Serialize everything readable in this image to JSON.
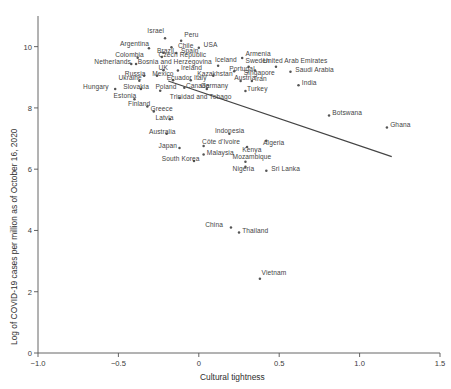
{
  "chart_data": {
    "type": "scatter",
    "title": "",
    "xlabel": "Cultural tightness",
    "ylabel": "Log of COVID-19 cases per million as of October 16, 2020",
    "xlim": [
      -1.0,
      1.5
    ],
    "ylim": [
      0,
      11
    ],
    "xticks": [
      "-1.0",
      "-0.5",
      "0",
      "0.5",
      "1.0",
      "1.5"
    ],
    "xtick_values": [
      -1.0,
      -0.5,
      0,
      0.5,
      1.0,
      1.5
    ],
    "yticks": [
      "0",
      "2",
      "4",
      "6",
      "8",
      "10"
    ],
    "ytick_values": [
      0,
      2,
      4,
      6,
      8,
      10
    ],
    "grid": false,
    "legend": "none",
    "marker_color": "#555555",
    "line_color": "#444444",
    "trendline": {
      "x0": -0.19,
      "y0": 8.88,
      "x1": 1.2,
      "y1": 6.41
    },
    "points": [
      {
        "label": "Israel",
        "x": -0.21,
        "y": 10.27,
        "lx": -0.32,
        "ly": 10.47
      },
      {
        "label": "Peru",
        "x": -0.11,
        "y": 10.19,
        "lx": -0.09,
        "ly": 10.36
      },
      {
        "label": "Argentina",
        "x": -0.31,
        "y": 9.95,
        "lx": -0.49,
        "ly": 10.04
      },
      {
        "label": "Chile",
        "x": -0.17,
        "y": 9.98,
        "lx": -0.13,
        "ly": 10.0
      },
      {
        "label": "USA",
        "x": 0.0,
        "y": 9.96,
        "lx": 0.03,
        "ly": 10.03
      },
      {
        "label": "Brazil",
        "x": -0.22,
        "y": 9.8,
        "lx": -0.26,
        "ly": 9.84
      },
      {
        "label": "Spain",
        "x": -0.14,
        "y": 9.79,
        "lx": -0.11,
        "ly": 9.83
      },
      {
        "label": "Colombia",
        "x": -0.38,
        "y": 9.64,
        "lx": -0.52,
        "ly": 9.68
      },
      {
        "label": "Czech Republic",
        "x": -0.23,
        "y": 9.66,
        "lx": -0.25,
        "ly": 9.7
      },
      {
        "label": "Armenia",
        "x": 0.27,
        "y": 9.63,
        "lx": 0.29,
        "ly": 9.73
      },
      {
        "label": "Netherlands",
        "x": -0.42,
        "y": 9.43,
        "lx": -0.65,
        "ly": 9.47
      },
      {
        "label": "Bosnia and Herzegovina",
        "x": -0.39,
        "y": 9.43,
        "lx": -0.38,
        "ly": 9.47
      },
      {
        "label": "Iceland",
        "x": 0.12,
        "y": 9.38,
        "lx": 0.1,
        "ly": 9.53
      },
      {
        "label": "Sweden",
        "x": 0.31,
        "y": 9.34,
        "lx": 0.29,
        "ly": 9.5
      },
      {
        "label": "United Arab Emirates",
        "x": 0.48,
        "y": 9.34,
        "lx": 0.4,
        "ly": 9.51
      },
      {
        "label": "UK",
        "x": -0.22,
        "y": 9.23,
        "lx": -0.25,
        "ly": 9.28
      },
      {
        "label": "Ireland",
        "x": -0.13,
        "y": 9.22,
        "lx": -0.11,
        "ly": 9.27
      },
      {
        "label": "Portugal",
        "x": 0.22,
        "y": 9.2,
        "lx": 0.19,
        "ly": 9.25
      },
      {
        "label": "Singapore",
        "x": 0.35,
        "y": 9.22,
        "lx": 0.28,
        "ly": 9.12
      },
      {
        "label": "Saudi Arabia",
        "x": 0.57,
        "y": 9.18,
        "lx": 0.6,
        "ly": 9.21
      },
      {
        "label": "Russia",
        "x": -0.34,
        "y": 9.05,
        "lx": -0.46,
        "ly": 9.09
      },
      {
        "label": "Mexico",
        "x": -0.26,
        "y": 9.05,
        "lx": -0.29,
        "ly": 9.09
      },
      {
        "label": "Kazakhstan",
        "x": 0.09,
        "y": 9.05,
        "lx": -0.01,
        "ly": 9.09
      },
      {
        "label": "Ukraine",
        "x": -0.37,
        "y": 8.89,
        "lx": -0.5,
        "ly": 8.93
      },
      {
        "label": "Ecuador",
        "x": -0.16,
        "y": 8.9,
        "lx": -0.2,
        "ly": 8.94
      },
      {
        "label": "Italy",
        "x": -0.05,
        "y": 8.9,
        "lx": -0.03,
        "ly": 8.94
      },
      {
        "label": "Austria",
        "x": 0.26,
        "y": 8.88,
        "lx": 0.22,
        "ly": 8.93
      },
      {
        "label": "Iran",
        "x": 0.33,
        "y": 8.88,
        "lx": 0.35,
        "ly": 8.92
      },
      {
        "label": "Hungary",
        "x": -0.52,
        "y": 8.62,
        "lx": -0.72,
        "ly": 8.66
      },
      {
        "label": "Slovakia",
        "x": -0.36,
        "y": 8.62,
        "lx": -0.47,
        "ly": 8.66
      },
      {
        "label": "Poland",
        "x": -0.24,
        "y": 8.56,
        "lx": -0.27,
        "ly": 8.65
      },
      {
        "label": "Canada",
        "x": -0.09,
        "y": 8.66,
        "lx": -0.08,
        "ly": 8.68
      },
      {
        "label": "Germany",
        "x": 0.05,
        "y": 8.62,
        "lx": 0.01,
        "ly": 8.67
      },
      {
        "label": "Turkey",
        "x": 0.29,
        "y": 8.55,
        "lx": 0.3,
        "ly": 8.58
      },
      {
        "label": "Estonia",
        "x": -0.4,
        "y": 8.28,
        "lx": -0.53,
        "ly": 8.36
      },
      {
        "label": "Trinidad and Tobago",
        "x": -0.12,
        "y": 8.32,
        "lx": -0.18,
        "ly": 8.33
      },
      {
        "label": "India",
        "x": 0.62,
        "y": 8.74,
        "lx": 0.64,
        "ly": 8.78
      },
      {
        "label": "Finland",
        "x": -0.32,
        "y": 8.05,
        "lx": -0.44,
        "ly": 8.1
      },
      {
        "label": "Greece",
        "x": -0.28,
        "y": 7.88,
        "lx": -0.3,
        "ly": 7.93
      },
      {
        "label": "Latvia",
        "x": -0.18,
        "y": 7.63,
        "lx": -0.27,
        "ly": 7.65
      },
      {
        "label": "Botswana",
        "x": 0.81,
        "y": 7.75,
        "lx": 0.83,
        "ly": 7.79
      },
      {
        "label": "Ghana",
        "x": 1.17,
        "y": 7.36,
        "lx": 1.19,
        "ly": 7.41
      },
      {
        "label": "Australia",
        "x": -0.2,
        "y": 7.16,
        "lx": -0.31,
        "ly": 7.18
      },
      {
        "label": "Indonesia",
        "x": 0.19,
        "y": 7.16,
        "lx": 0.1,
        "ly": 7.2
      },
      {
        "label": "Algeria",
        "x": 0.42,
        "y": 6.93,
        "lx": 0.4,
        "ly": 6.83
      },
      {
        "label": "Côte d'Ivoire",
        "x": 0.03,
        "y": 6.76,
        "lx": 0.02,
        "ly": 6.86
      },
      {
        "label": "Japan",
        "x": -0.12,
        "y": 6.69,
        "lx": -0.25,
        "ly": 6.72
      },
      {
        "label": "Kenya",
        "x": 0.3,
        "y": 6.72,
        "lx": 0.27,
        "ly": 6.58
      },
      {
        "label": "Malaysia",
        "x": 0.03,
        "y": 6.48,
        "lx": 0.05,
        "ly": 6.5
      },
      {
        "label": "Mozambique",
        "x": 0.29,
        "y": 6.24,
        "lx": 0.21,
        "ly": 6.36
      },
      {
        "label": "South Korea",
        "x": -0.03,
        "y": 6.27,
        "lx": -0.23,
        "ly": 6.29
      },
      {
        "label": "Nigeria",
        "x": 0.29,
        "y": 6.08,
        "lx": 0.21,
        "ly": 5.96
      },
      {
        "label": "Sri Lanka",
        "x": 0.42,
        "y": 5.95,
        "lx": 0.45,
        "ly": 5.98
      },
      {
        "label": "China",
        "x": 0.2,
        "y": 4.1,
        "lx": 0.04,
        "ly": 4.13
      },
      {
        "label": "Thailand",
        "x": 0.25,
        "y": 3.93,
        "lx": 0.27,
        "ly": 3.96
      },
      {
        "label": "Vietnam",
        "x": 0.38,
        "y": 2.42,
        "lx": 0.39,
        "ly": 2.57
      }
    ]
  }
}
